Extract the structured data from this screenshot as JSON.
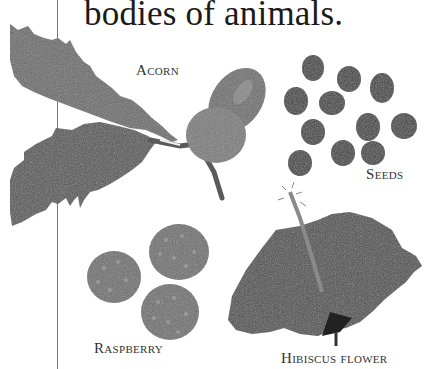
{
  "page": {
    "body_text": "bodies of animals."
  },
  "specimens": [
    {
      "id": "acorn",
      "label": "Acorn"
    },
    {
      "id": "seeds",
      "label": "Seeds"
    },
    {
      "id": "raspberry",
      "label": "Raspberry"
    },
    {
      "id": "hibiscus",
      "label": "Hibiscus flower"
    }
  ],
  "colors": {
    "ink": "#1a1a1a",
    "label": "#333333",
    "leaf": "#5a5a5a",
    "seed": "#3c3c3c",
    "rule": "#777777"
  }
}
